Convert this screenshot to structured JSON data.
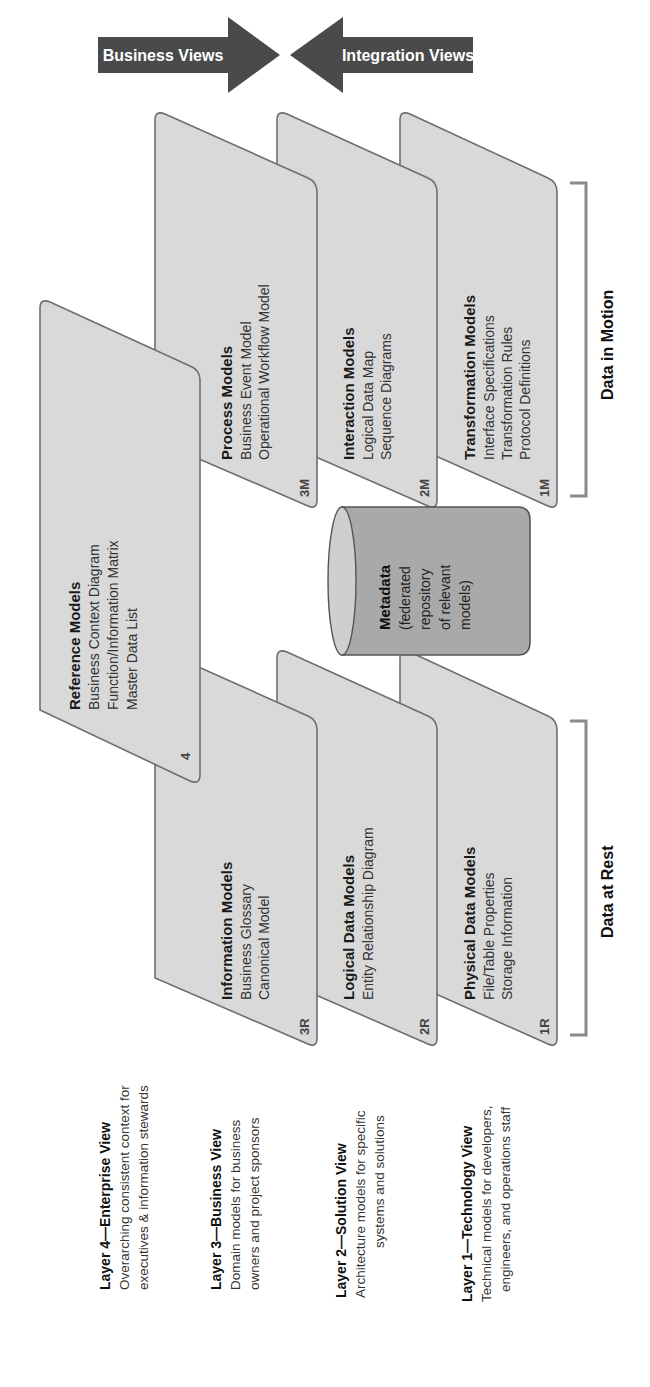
{
  "arrows": {
    "left": "Business Views",
    "right": "Integration Views"
  },
  "reference": {
    "title": "Reference Models",
    "items": [
      "Business Context Diagram",
      "Function/Information Matrix",
      "Master Data List"
    ],
    "code": "4"
  },
  "motion_cards": [
    {
      "title": "Process Models",
      "items": [
        "Business Event Model",
        "Operational Workflow Model"
      ],
      "code": "3M"
    },
    {
      "title": "Interaction Models",
      "items": [
        "Logical Data Map",
        "Sequence Diagrams"
      ],
      "code": "2M"
    },
    {
      "title": "Transformation Models",
      "items": [
        "Interface Specifications",
        "Transformation Rules",
        "Protocol Definitions"
      ],
      "code": "1M"
    }
  ],
  "rest_cards": [
    {
      "title": "Information Models",
      "items": [
        "Business Glossary",
        "Canonical Model"
      ],
      "code": "3R"
    },
    {
      "title": "Logical Data Models",
      "items": [
        "Entity Relationship Diagram"
      ],
      "code": "2R"
    },
    {
      "title": "Physical Data Models",
      "items": [
        "File/Table Properties",
        "Storage Information"
      ],
      "code": "1R"
    }
  ],
  "metadata": {
    "title": "Metadata",
    "lines": [
      "(federated",
      "repository",
      "of relevant",
      "models)"
    ]
  },
  "brackets": {
    "motion": "Data in Motion",
    "rest": "Data at Rest"
  },
  "layers": [
    {
      "title": "Layer 4—Enterprise View",
      "lines": [
        "Overarching consistent context for",
        "executives & information stewards"
      ]
    },
    {
      "title": "Layer 3—Business View",
      "lines": [
        "Domain models for business",
        "owners and project sponsors"
      ]
    },
    {
      "title": "Layer 2—Solution View",
      "lines": [
        "Architecture models for specific",
        "systems and solutions"
      ]
    },
    {
      "title": "Layer 1—Technology View",
      "lines": [
        "Technical models for developers,",
        "engineers, and operations staff"
      ]
    }
  ],
  "colors": {
    "arrow": "#4a4a4a",
    "card": "#d9d9d9",
    "card_border": "#6e6e6e",
    "cylinder": "#a9a9a9",
    "bracket": "#8a8a8a"
  }
}
